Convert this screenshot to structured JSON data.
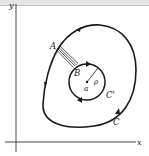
{
  "figure": {
    "axes": {
      "x_label": "x",
      "y_label": "y"
    },
    "outer_curve": {
      "label": "C",
      "orientation": "counterclockwise"
    },
    "inner_circle": {
      "label": "C'",
      "center_label": "a",
      "radius_label": "ρ",
      "orientation": "clockwise"
    },
    "cut": {
      "start_label": "A",
      "end_label": "B"
    },
    "colors": {
      "stroke": "#1a1a1a",
      "background": "#ffffff",
      "header": "#e4e4e4"
    }
  }
}
